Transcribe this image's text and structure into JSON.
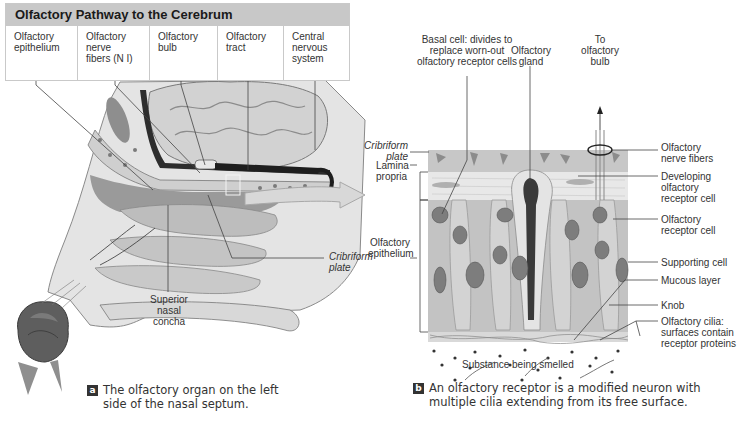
{
  "pathway": {
    "title": "Olfactory Pathway to the Cerebrum",
    "columns": [
      {
        "label": "Olfactory epithelium",
        "line1": "Olfactory",
        "line2": "epithelium",
        "line3": ""
      },
      {
        "label": "Olfactory nerve fibers (N I)",
        "line1": "Olfactory",
        "line2": "nerve",
        "line3": "fibers (N I)"
      },
      {
        "label": "Olfactory bulb",
        "line1": "Olfactory",
        "line2": "bulb",
        "line3": ""
      },
      {
        "label": "Olfactory tract",
        "line1": "Olfactory",
        "line2": "tract",
        "line3": ""
      },
      {
        "label": "Central nervous system",
        "line1": "Central",
        "line2": "nervous",
        "line3": "system"
      }
    ]
  },
  "panel_a": {
    "badge": "a",
    "caption_line1": "The olfactory organ on the left",
    "caption_line2": "side of the nasal septum.",
    "labels": {
      "cribriform_plate": [
        "Cribriform",
        "plate"
      ],
      "superior_nasal_concha": [
        "Superior",
        "nasal",
        "concha"
      ]
    }
  },
  "panel_b": {
    "badge": "b",
    "caption_line1": "An olfactory receptor is a modified neuron with",
    "caption_line2": "multiple cilia extending from its free surface.",
    "labels": {
      "basal_cell": [
        "Basal cell: divides to",
        "replace worn-out",
        "olfactory receptor cells"
      ],
      "olfactory_gland": [
        "Olfactory",
        "gland"
      ],
      "to_olfactory_bulb": [
        "To",
        "olfactory",
        "bulb"
      ],
      "cribriform_plate": [
        "Cribriform",
        "plate"
      ],
      "lamina_propria": [
        "Lamina",
        "propria"
      ],
      "olfactory_epithelium": [
        "Olfactory",
        "epithelium"
      ],
      "olfactory_nerve_fibers": [
        "Olfactory",
        "nerve fibers"
      ],
      "developing_receptor_cell": [
        "Developing",
        "olfactory",
        "receptor cell"
      ],
      "olfactory_receptor_cell": [
        "Olfactory",
        "receptor cell"
      ],
      "supporting_cell": [
        "Supporting cell"
      ],
      "mucous_layer": [
        "Mucous layer"
      ],
      "knob": [
        "Knob"
      ],
      "olfactory_cilia": [
        "Olfactory cilia:",
        "surfaces contain",
        "receptor proteins"
      ],
      "substance_smelled": [
        "Substance being smelled"
      ]
    }
  },
  "colors": {
    "title_bar": "#c8c8c8",
    "tissue_light": "#dcdcdc",
    "tissue_mid": "#b5b5b5",
    "tissue_dark": "#6e6e6e",
    "nucleus": "#7d7d7d",
    "arrow_fill": "#d8d8d8",
    "badge": "#333333"
  }
}
